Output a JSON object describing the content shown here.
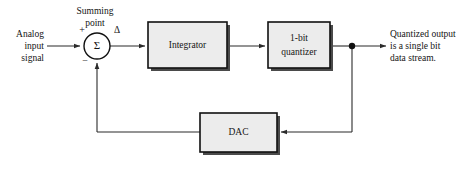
{
  "diagram": {
    "colors": {
      "block_fill": "#ececec",
      "block_border": "#111111",
      "block_shadow": "#4a4a4a",
      "wire": "#2b2b2b",
      "text": "#141414",
      "background": "#ffffff"
    },
    "blocks": [
      {
        "id": "integrator",
        "label": "Integrator",
        "x": 148,
        "y": 22,
        "w": 79,
        "h": 46
      },
      {
        "id": "quantizer",
        "label_line1": "1-bit",
        "label_line2": "quantizer",
        "x": 268,
        "y": 22,
        "w": 62,
        "h": 46
      },
      {
        "id": "dac",
        "label": "DAC",
        "x": 200,
        "y": 113,
        "w": 77,
        "h": 39
      }
    ],
    "summing_point": {
      "caption_line1": "Summing",
      "caption_line2": "point",
      "symbol": "Σ",
      "plus_sign": "+",
      "minus_sign": "−",
      "output_label": "Δ",
      "cx": 97,
      "cy": 46,
      "r": 13
    },
    "input_label": {
      "line1": "Analog",
      "line2": "input",
      "line3": "signal"
    },
    "output_label": {
      "line1": "Quantized output",
      "line2": "is a single bit",
      "line3": "data stream."
    },
    "junction": {
      "x": 352,
      "y": 46
    },
    "feedback": {
      "bottom_y": 132,
      "left_x": 97
    }
  }
}
